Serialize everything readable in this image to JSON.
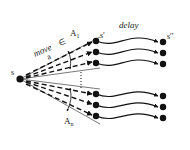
{
  "diagram": {
    "type": "state-transition-fan",
    "labels": {
      "source": "s",
      "move_word": "move",
      "move_var": "a",
      "element_of": "∈",
      "set_top": "A",
      "set_top_sub": "1",
      "set_bottom": "A",
      "set_bottom_sub": "n",
      "mid_state": "s′",
      "delay": "delay",
      "final_state": "s′′"
    },
    "colors": {
      "ink": "#111111",
      "line": "#555555",
      "background": "#ffffff"
    },
    "nodes": {
      "source": {
        "x": 20,
        "y": 79
      },
      "mid_upper": [
        {
          "x": 96,
          "y": 41
        },
        {
          "x": 96,
          "y": 52
        },
        {
          "x": 96,
          "y": 63
        }
      ],
      "mid_lower": [
        {
          "x": 96,
          "y": 94
        },
        {
          "x": 96,
          "y": 105
        },
        {
          "x": 96,
          "y": 116
        }
      ],
      "final_upper": [
        {
          "x": 162,
          "y": 42
        },
        {
          "x": 162,
          "y": 53
        },
        {
          "x": 162,
          "y": 64
        }
      ],
      "final_lower": [
        {
          "x": 162,
          "y": 96
        },
        {
          "x": 162,
          "y": 107
        },
        {
          "x": 162,
          "y": 118
        }
      ]
    }
  }
}
